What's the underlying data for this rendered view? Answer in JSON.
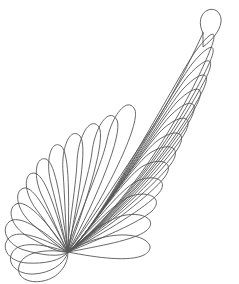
{
  "canvas": {
    "width": 239,
    "height": 284,
    "background_color": "#ffffff",
    "title": "Feather Plume Line Art"
  },
  "artwork": {
    "name": "feather-plume",
    "style": "line-art",
    "description": "Single quilting-style feather plume drawn as unfilled outlines",
    "stroke_color": "#575757",
    "stroke_width": 0.9,
    "fill": "none",
    "base_point": {
      "x": 68,
      "y": 252
    },
    "tip_point": {
      "x": 205,
      "y": 25
    },
    "spine": {
      "name": "spine",
      "d": "M 68 252 C 96 214 124 170 152 128 C 170 100 188 66 203 33"
    },
    "tip_teardrop": {
      "name": "tip-teardrop",
      "d": "M 203 33 C 198 24 200 13 208 10 C 216 7 222 14 221 22 C 220 31 212 40 203 47 C 203 42 203 37 203 33 Z"
    },
    "left_plumes": [
      {
        "index": 0,
        "d": "M 68 252 C 40 248 22 254 19 266 C 16 277 28 284 43 281 C 58 278 68 266 68 252 Z"
      },
      {
        "index": 1,
        "d": "M 68 252 C 38 242 18 242 12 253 C 6 264 18 275 34 274 C 50 273 64 265 68 252 Z"
      },
      {
        "index": 2,
        "d": "M 68 252 C 38 235 16 229 8 239 C 0 249 10 262 27 263 C 44 264 61 261 68 252 Z"
      },
      {
        "index": 3,
        "d": "M 68 252 C 40 227 18 214 9 222 C 0 230 8 245 24 250 C 41 255 60 258 68 252 Z"
      },
      {
        "index": 4,
        "d": "M 68 252 C 45 219 26 199 16 204 C 6 210 12 227 27 236 C 43 245 61 254 68 252 Z"
      },
      {
        "index": 5,
        "d": "M 68 252 C 49 214 34 186 24 188 C 13 191 17 210 31 223 C 46 236 62 250 68 252 Z"
      },
      {
        "index": 6,
        "d": "M 68 252 C 55 208 45 174 34 173 C 23 173 24 193 36 209 C 49 226 63 247 68 252 Z"
      },
      {
        "index": 7,
        "d": "M 68 252 C 61 204 56 163 46 159 C 35 156 33 177 42 196 C 52 216 64 246 68 252 Z"
      },
      {
        "index": 8,
        "d": "M 68 252 C 69 201 70 153 61 146 C 51 139 45 161 51 183 C 57 206 66 245 68 252 Z"
      },
      {
        "index": 9,
        "d": "M 68 252 C 78 199 88 146 80 136 C 70 126 61 148 63 172 C 65 197 66 244 68 252 Z"
      },
      {
        "index": 10,
        "d": "M 68 252 C 88 198 106 139 99 127 C 90 115 78 137 77 162 C 76 188 66 244 68 252 Z"
      },
      {
        "index": 11,
        "d": "M 68 252 C 98 196 123 134 117 120 C 109 106 95 127 92 152 C 89 179 66 244 68 252 Z"
      },
      {
        "index": 12,
        "d": "M 68 252 C 108 192 140 125 135 110 C 128 95 112 115 107 140 C 102 167 66 244 68 252 Z"
      }
    ],
    "right_plumes": [
      {
        "index": 0,
        "d": "M 68 252 C 98 258 130 262 144 255 C 158 247 146 236 126 235 C 105 234 79 244 68 252 Z"
      },
      {
        "index": 1,
        "d": "M 68 252 C 100 246 134 240 146 231 C 158 221 145 212 126 215 C 106 218 79 242 68 252 Z"
      },
      {
        "index": 2,
        "d": "M 68 252 C 102 238 140 222 152 211 C 164 199 150 190 131 196 C 112 203 80 241 68 252 Z"
      },
      {
        "index": 3,
        "d": "M 68 252 C 106 232 146 207 158 194 C 170 181 156 173 137 181 C 118 190 82 240 68 252 Z"
      },
      {
        "index": 4,
        "d": "M 68 252 C 110 227 152 193 164 178 C 176 163 162 156 143 166 C 124 177 84 239 68 252 Z"
      },
      {
        "index": 5,
        "d": "M 68 252 C 114 222 158 181 171 164 C 183 147 169 141 150 153 C 131 166 85 239 68 252 Z"
      },
      {
        "index": 6,
        "d": "M 68 252 C 118 218 164 169 177 150 C 189 132 176 127 157 141 C 138 155 86 238 68 252 Z"
      },
      {
        "index": 7,
        "d": "M 68 252 C 122 214 170 157 183 136 C 196 116 183 112 164 128 C 145 144 87 238 68 252 Z"
      },
      {
        "index": 8,
        "d": "M 68 252 C 126 210 176 145 189 122 C 202 100 189 97 171 115 C 152 133 88 238 68 252 Z"
      },
      {
        "index": 9,
        "d": "M 68 252 C 130 206 182 132 195 108 C 208 85 196 83 177 102 C 158 122 89 237 68 252 Z"
      },
      {
        "index": 10,
        "d": "M 68 252 C 134 202 188 119 201 94 C 214 70 202 69 183 89 C 164 110 90 237 68 252 Z"
      },
      {
        "index": 11,
        "d": "M 68 252 C 138 198 192 105 205 80 C 218 55 207 55 188 76 C 169 98 91 237 68 252 Z"
      },
      {
        "index": 12,
        "d": "M 68 252 C 142 194 196 92 208 66 C 220 41 210 42 192 64 C 174 87 92 237 68 252 Z"
      },
      {
        "index": 13,
        "d": "M 68 252 C 146 190 198 80 209 53 C 220 27 212 29 195 52 C 178 76 93 236 68 252 Z"
      }
    ]
  }
}
